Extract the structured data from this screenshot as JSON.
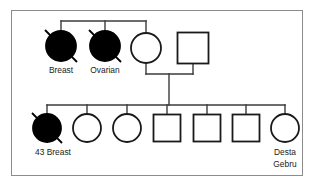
{
  "diagram": {
    "frame": {
      "stroke_color": "#8c8c8c",
      "background": "#ffffff"
    },
    "line_color": "#3b3b3b",
    "symbol_fill_affected": "#000000",
    "symbol_fill_unaffected": "#ffffff",
    "symbol_stroke": "#1a1a1a"
  },
  "generations": [
    {
      "name": "generation-1",
      "members": [
        {
          "id": "g1-p1",
          "sex": "female",
          "shape": "circle",
          "affected": true,
          "deceased": true,
          "label": "Breast",
          "label_lines": [
            "Breast"
          ],
          "cx": 61,
          "cy": 46,
          "r": 15
        },
        {
          "id": "g1-p2",
          "sex": "female",
          "shape": "circle",
          "affected": true,
          "deceased": true,
          "label": "Ovarian",
          "label_lines": [
            "Ovarian"
          ],
          "cx": 105,
          "cy": 46,
          "r": 15
        },
        {
          "id": "g1-p3",
          "sex": "female",
          "shape": "circle",
          "affected": false,
          "deceased": false,
          "label": "",
          "label_lines": [],
          "cx": 146,
          "cy": 48,
          "r": 15
        },
        {
          "id": "g1-p4",
          "sex": "male",
          "shape": "square",
          "affected": false,
          "deceased": false,
          "label": "",
          "label_lines": [],
          "cx": 193,
          "cy": 48,
          "size": 31
        }
      ]
    },
    {
      "name": "generation-2",
      "members": [
        {
          "id": "g2-p1",
          "sex": "female",
          "shape": "circle",
          "affected": true,
          "deceased": true,
          "label": "43 Breast",
          "label_lines": [
            "43 Breast"
          ],
          "cx": 47,
          "cy": 128,
          "r": 14
        },
        {
          "id": "g2-p2",
          "sex": "female",
          "shape": "circle",
          "affected": false,
          "deceased": false,
          "label": "",
          "label_lines": [],
          "cx": 87,
          "cy": 128,
          "r": 14
        },
        {
          "id": "g2-p3",
          "sex": "female",
          "shape": "circle",
          "affected": false,
          "deceased": false,
          "label": "",
          "label_lines": [],
          "cx": 127,
          "cy": 128,
          "r": 14
        },
        {
          "id": "g2-p4",
          "sex": "male",
          "shape": "square",
          "affected": false,
          "deceased": false,
          "label": "",
          "label_lines": [],
          "cx": 167,
          "cy": 128,
          "size": 27
        },
        {
          "id": "g2-p5",
          "sex": "male",
          "shape": "square",
          "affected": false,
          "deceased": false,
          "label": "",
          "label_lines": [],
          "cx": 207,
          "cy": 128,
          "size": 27
        },
        {
          "id": "g2-p6",
          "sex": "male",
          "shape": "square",
          "affected": false,
          "deceased": false,
          "label": "",
          "label_lines": [],
          "cx": 246,
          "cy": 128,
          "size": 27
        },
        {
          "id": "g2-p7",
          "sex": "female",
          "shape": "circle",
          "affected": false,
          "deceased": false,
          "label": "Desta Gebru",
          "label_lines": [
            "Desta",
            "Gebru"
          ],
          "cx": 285,
          "cy": 128,
          "r": 14
        }
      ]
    }
  ],
  "labels": {
    "g1_p1": "Breast",
    "g1_p2": "Ovarian",
    "g2_p1": "43 Breast",
    "g2_p7_line1": "Desta",
    "g2_p7_line2": "Gebru"
  }
}
